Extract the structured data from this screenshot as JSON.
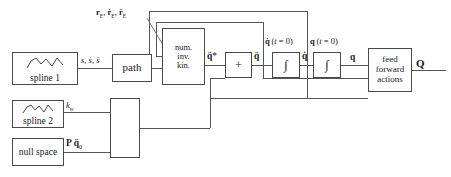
{
  "diagram": {
    "blocks": {
      "spline1": {
        "label": "spline 1",
        "icon": "spline-curve-icon"
      },
      "spline2": {
        "label": "spline 2",
        "icon": "spline-curve-icon"
      },
      "null_space": {
        "label": "null space"
      },
      "path": {
        "label": "path"
      },
      "mid": {
        "label": ""
      },
      "num_inv_kin": {
        "line1": "num.",
        "line2": "inv.",
        "line3": "kin."
      },
      "sum": {
        "label": "+"
      },
      "integrator1": {
        "label": "∫"
      },
      "integrator2": {
        "label": "∫"
      },
      "feed_forward": {
        "line1": "feed",
        "line2": "forward",
        "line3": "actions"
      }
    },
    "signals": {
      "spline1_out": "s, ṡ, s̈",
      "path_out": "r_E, ṙ_E, r̈_E",
      "spline2_out": "k_w",
      "null_space_out": "P q̈₀",
      "nik_out": "q̈*",
      "sum_out": "q̈",
      "int1_init": "q̇ (t = 0)",
      "int1_out": "q̇",
      "int2_init": "q (t = 0)",
      "int2_out": "q",
      "ff_out": "Q"
    },
    "colors": {
      "stroke": "#4a4a4a",
      "wire": "#555555",
      "background": "#ffffff",
      "text": "#1a1a1a"
    }
  }
}
